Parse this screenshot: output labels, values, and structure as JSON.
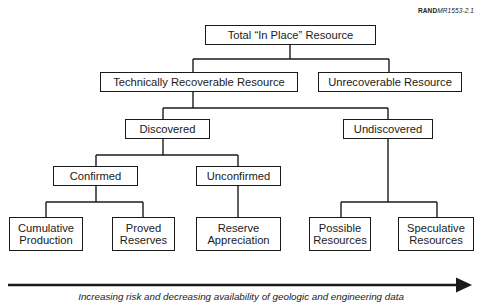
{
  "figure_id": {
    "prefix": "RAND",
    "suffix": "MR1553-2.1"
  },
  "nodes": {
    "total": "Total “In Place” Resource",
    "technically_recoverable": "Technically Recoverable Resource",
    "unrecoverable": "Unrecoverable Resource",
    "discovered": "Discovered",
    "undiscovered": "Undiscovered",
    "confirmed": "Confirmed",
    "unconfirmed": "Unconfirmed",
    "cumulative_production": "Cumulative\nProduction",
    "proved_reserves": "Proved\nReserves",
    "reserve_appreciation": "Reserve\nAppreciation",
    "possible_resources": "Possible\nResources",
    "speculative_resources": "Speculative\nResources"
  },
  "tree": {
    "Total “In Place” Resource": [
      "Technically Recoverable Resource",
      "Unrecoverable Resource"
    ],
    "Technically Recoverable Resource": [
      "Discovered",
      "Undiscovered"
    ],
    "Discovered": [
      "Confirmed",
      "Unconfirmed"
    ],
    "Confirmed": [
      "Cumulative Production",
      "Proved Reserves"
    ],
    "Unconfirmed": [
      "Reserve Appreciation"
    ],
    "Undiscovered": [
      "Possible Resources",
      "Speculative Resources"
    ]
  },
  "arrow": {
    "direction": "right",
    "caption": "Increasing risk and decreasing availability of geologic and engineering data"
  }
}
